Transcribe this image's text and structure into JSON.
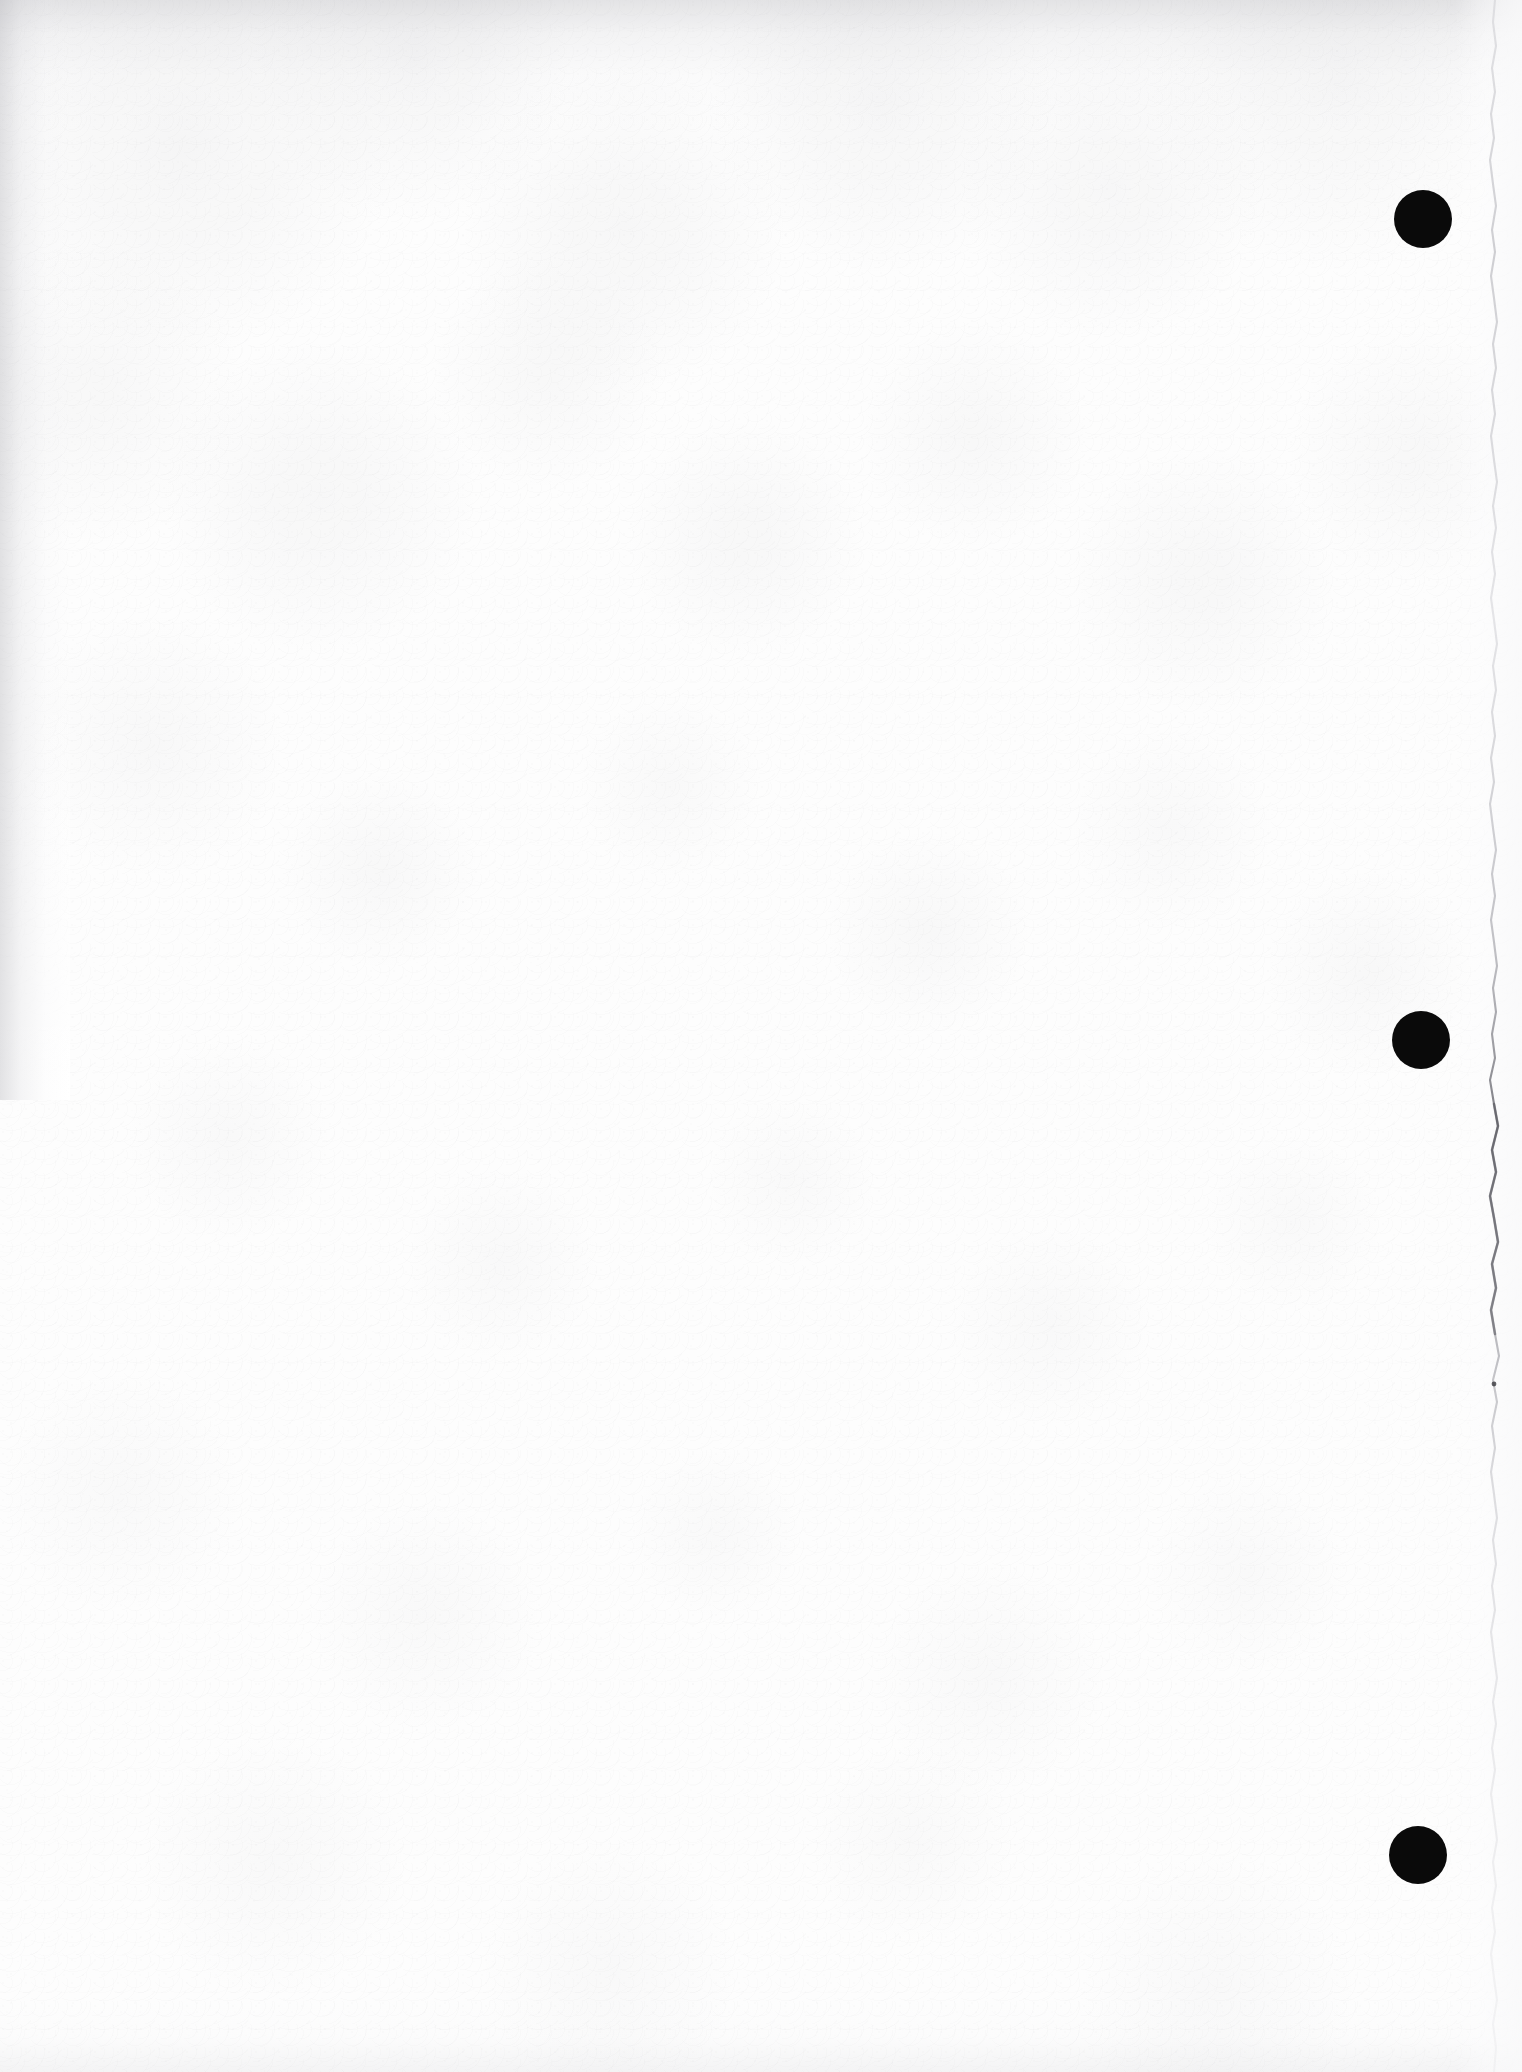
{
  "document": {
    "title": "Scanned blank page",
    "page_label": "",
    "body_text": "",
    "background_color": "#fefefe",
    "ink_color": "#0a0a0a",
    "width": 1522,
    "height": 2072
  },
  "marks": {
    "punch_dots": [
      {
        "name": "punch-dot-top",
        "cx": 1423,
        "cy": 219,
        "diameter": 58,
        "color": "#0a0a0a"
      },
      {
        "name": "punch-dot-middle",
        "cx": 1421,
        "cy": 1040,
        "diameter": 58,
        "color": "#0a0a0a"
      },
      {
        "name": "punch-dot-bottom",
        "cx": 1418,
        "cy": 1855,
        "diameter": 58,
        "color": "#0a0a0a"
      }
    ],
    "torn_edge": {
      "name": "torn-right-edge",
      "orientation": "vertical",
      "x": 1494,
      "color": "#b9b9be",
      "darkest_span_y": [
        1090,
        1360
      ]
    },
    "edge_shading": [
      {
        "name": "top-edge-shadow",
        "edge": "top",
        "extent": 130
      },
      {
        "name": "left-edge-shadow",
        "edge": "left",
        "extent": 70
      },
      {
        "name": "bottom-edge-shadow",
        "edge": "bottom",
        "extent": 70
      }
    ]
  }
}
